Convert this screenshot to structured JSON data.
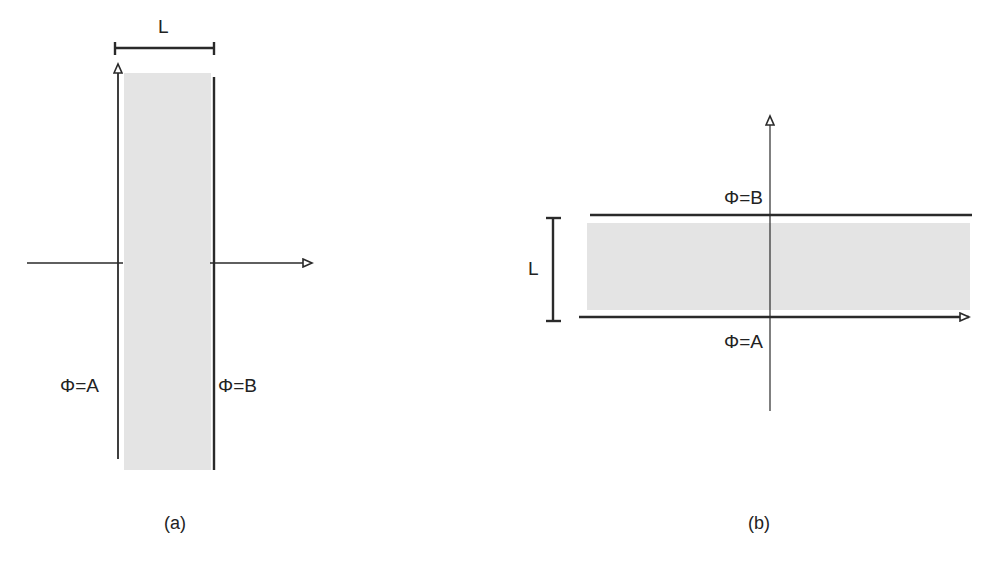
{
  "diagram": {
    "panels": [
      {
        "id": "a",
        "caption": "(a)",
        "orientation": "vertical slab",
        "thickness_label": "L",
        "left_boundary_label": "Φ=A",
        "right_boundary_label": "Φ=B"
      },
      {
        "id": "b",
        "caption": "(b)",
        "orientation": "horizontal slab",
        "thickness_label": "L",
        "top_boundary_label": "Φ=B",
        "bottom_boundary_label": "Φ=A"
      }
    ],
    "colors": {
      "line": "#2a2a2a",
      "slab_fill": "#e4e4e4",
      "background": "#ffffff"
    }
  }
}
